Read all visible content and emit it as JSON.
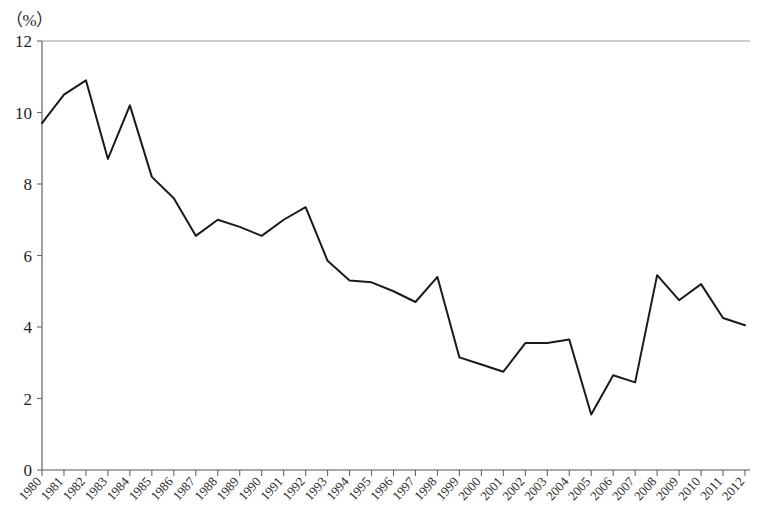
{
  "chart_data": {
    "type": "line",
    "title": "",
    "subtitle": "",
    "xlabel": "",
    "ylabel": "",
    "unit_label": "（%）",
    "ylim": [
      0,
      12
    ],
    "yticks": [
      0,
      2,
      4,
      6,
      8,
      10,
      12
    ],
    "ytick_labels": [
      "0",
      "2",
      "4",
      "6",
      "8",
      "10",
      "12"
    ],
    "grid": false,
    "legend": false,
    "legend_position": "none",
    "categories": [
      "1980",
      "1981",
      "1982",
      "1983",
      "1984",
      "1985",
      "1986",
      "1987",
      "1988",
      "1989",
      "1990",
      "1991",
      "1992",
      "1993",
      "1994",
      "1995",
      "1996",
      "1997",
      "1998",
      "1999",
      "2000",
      "2001",
      "2002",
      "2003",
      "2004",
      "2005",
      "2006",
      "2007",
      "2008",
      "2009",
      "2010",
      "2011",
      "2012"
    ],
    "values": [
      9.7,
      10.5,
      10.9,
      8.7,
      10.2,
      8.2,
      7.6,
      6.55,
      7.0,
      6.8,
      6.55,
      7.0,
      7.35,
      5.85,
      5.3,
      5.25,
      5.0,
      4.7,
      5.4,
      3.15,
      2.95,
      2.75,
      3.55,
      3.55,
      3.65,
      1.55,
      2.65,
      2.45,
      5.45,
      4.75,
      5.2,
      4.25,
      4.05
    ],
    "series": [
      {
        "name": "series-1",
        "color": "#1a1a1a",
        "values": [
          9.7,
          10.5,
          10.9,
          8.7,
          10.2,
          8.2,
          7.6,
          6.55,
          7.0,
          6.8,
          6.55,
          7.0,
          7.35,
          5.85,
          5.3,
          5.25,
          5.0,
          4.7,
          5.4,
          3.15,
          2.95,
          2.75,
          3.55,
          3.55,
          3.65,
          1.55,
          2.65,
          2.45,
          5.45,
          4.75,
          5.2,
          4.25,
          4.05
        ]
      }
    ],
    "colors": {
      "line": "#1a1a1a",
      "axis": "#555555",
      "top_border": "#9a9a9a",
      "text": "#1f1f1f",
      "background": "#ffffff"
    }
  }
}
